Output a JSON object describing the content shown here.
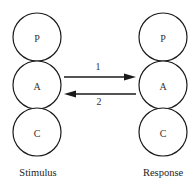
{
  "diagram": {
    "type": "transactional-analysis",
    "columns": [
      {
        "label": "Stimulus",
        "states": [
          "P",
          "A",
          "C"
        ]
      },
      {
        "label": "Response",
        "states": [
          "P",
          "A",
          "C"
        ]
      }
    ],
    "transactions": [
      {
        "label": "1",
        "from": "Stimulus.A",
        "to": "Response.A",
        "direction": "right"
      },
      {
        "label": "2",
        "from": "Response.A",
        "to": "Stimulus.A",
        "direction": "left"
      }
    ],
    "colors": {
      "stroke": "#1a1a1a",
      "background": "#ffffff",
      "text": "#333333"
    }
  }
}
